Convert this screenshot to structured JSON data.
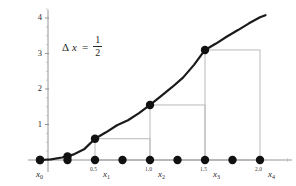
{
  "chart_data": {
    "type": "line",
    "title": "",
    "subtitle": "",
    "xlabel": "",
    "ylabel": "",
    "annotation": {
      "delta_symbol": "Δ",
      "variable": "x",
      "equals": "=",
      "numerator": "1",
      "denominator": "2",
      "full_text": "Δx = 1/2"
    },
    "xlim": [
      -0.15,
      2.25
    ],
    "ylim": [
      -0.35,
      4.35
    ],
    "grid": false,
    "legend": null,
    "axis_color": "#8a8a8a",
    "curve_color": "#1a1a1a",
    "rect_color": "#b9b9b9",
    "dot_color": "#111111",
    "y_ticks": [
      {
        "value": 1,
        "label": "1"
      },
      {
        "value": 2,
        "label": "2"
      },
      {
        "value": 3,
        "label": "3"
      },
      {
        "value": 4,
        "label": "4"
      }
    ],
    "y_minor_ticks": [
      0.25,
      0.5,
      0.75,
      1.25,
      1.5,
      1.75,
      2.25,
      2.5,
      2.75,
      3.25,
      3.5,
      3.75,
      4.25
    ],
    "x_ticks": [
      {
        "value": 0.0,
        "number": "",
        "symbol": "x",
        "sub": "0"
      },
      {
        "value": 0.5,
        "number": "0.5",
        "symbol": "x",
        "sub": "1"
      },
      {
        "value": 1.0,
        "number": "1.0",
        "symbol": "x",
        "sub": "2"
      },
      {
        "value": 1.5,
        "number": "1.5",
        "symbol": "x",
        "sub": "3"
      },
      {
        "value": 2.0,
        "number": "2.0",
        "symbol": "x",
        "sub": "4"
      }
    ],
    "x_minor_ticks": [
      0.25,
      0.75,
      1.25,
      1.75,
      2.25
    ],
    "curve": {
      "name": "f(x)",
      "x": [
        0.0,
        0.1,
        0.2,
        0.3,
        0.4,
        0.5,
        0.6,
        0.7,
        0.8,
        0.9,
        1.0,
        1.1,
        1.2,
        1.3,
        1.4,
        1.5,
        1.6,
        1.7,
        1.8,
        1.9,
        2.0,
        2.05
      ],
      "y": [
        0.0,
        0.02,
        0.07,
        0.15,
        0.3,
        0.6,
        0.78,
        0.98,
        1.12,
        1.32,
        1.55,
        1.8,
        2.05,
        2.32,
        2.68,
        3.1,
        3.28,
        3.48,
        3.66,
        3.85,
        4.02,
        4.08
      ]
    },
    "axis_dots": {
      "label": "x-axis sample points",
      "x": [
        0.0,
        0.25,
        0.5,
        0.75,
        1.0,
        1.25,
        1.5,
        1.75,
        2.0
      ],
      "y": 0
    },
    "curve_dots": {
      "label": "function values at partition points",
      "points": [
        {
          "x": 0.0,
          "y": 0.0
        },
        {
          "x": 0.25,
          "y": 0.1
        },
        {
          "x": 0.5,
          "y": 0.6
        },
        {
          "x": 1.0,
          "y": 1.55
        },
        {
          "x": 1.5,
          "y": 3.1
        }
      ]
    },
    "rectangles": [
      {
        "x0": 0.5,
        "x1": 1.0,
        "height": 0.6
      },
      {
        "x0": 1.0,
        "x1": 1.5,
        "height": 1.55
      },
      {
        "x0": 1.5,
        "x1": 2.0,
        "height": 3.1
      }
    ]
  }
}
